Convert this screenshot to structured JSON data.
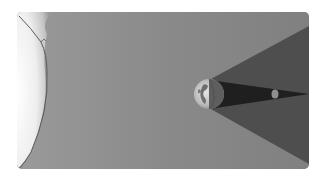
{
  "diagram": {
    "elements": [
      {
        "id": "sun",
        "label": "Sun"
      },
      {
        "id": "earth",
        "label": "Earth"
      },
      {
        "id": "moon",
        "label": "Moon"
      },
      {
        "id": "umbra",
        "label": "Umbra"
      },
      {
        "id": "penumbra",
        "label": "Penumbra"
      }
    ],
    "colors": {
      "background": "#8a8a8a",
      "sun_glow": "#f2f2f2",
      "penumbra": "#4a4a4a",
      "umbra": "#1e1e1e",
      "earth_day": "#c8c8c8",
      "earth_night": "#5a5a5a",
      "moon": "#9a9a9a"
    }
  }
}
